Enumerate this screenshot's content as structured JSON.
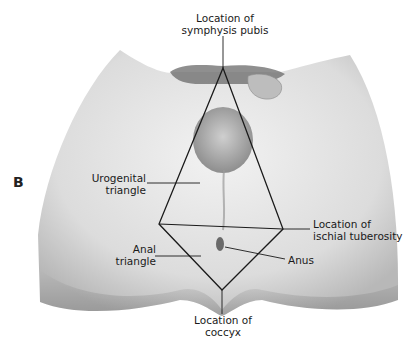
{
  "figure": {
    "panel_letter": "B",
    "labels": {
      "symphysis": [
        "Location of",
        "symphysis pubis"
      ],
      "urogenital": [
        "Urogenital",
        "triangle"
      ],
      "ischial": [
        "Location of",
        "ischial tuberosity"
      ],
      "anal": [
        "Anal",
        "triangle"
      ],
      "anus": [
        "Anus"
      ],
      "coccyx": [
        "Location of",
        "coccyx"
      ]
    },
    "colors": {
      "outline": "#1a1a1a",
      "skin_light": "#ececec",
      "skin_mid": "#d2d2d2",
      "skin_dark": "#9a9a9a",
      "hair": "#5a5a5a"
    }
  }
}
